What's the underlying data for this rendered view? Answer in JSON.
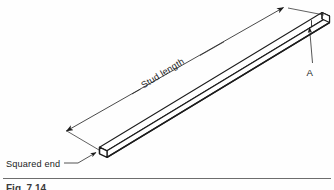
{
  "figure": {
    "type": "engineering-drawing",
    "subject": "stud",
    "background_color": "#fefefe",
    "line_color": "#1c1c1c",
    "labels": {
      "dimension": "Stud length",
      "left_end": "Squared end",
      "detail_callout": "A"
    },
    "caption": "Fig. 7.14",
    "annotations": [
      {
        "name": "dimension-label",
        "text": "Stud length",
        "kind": "dimension",
        "rotation_deg": -31.5
      },
      {
        "name": "left-end-label",
        "text": "Squared end",
        "kind": "leader-note"
      },
      {
        "name": "detail-label",
        "text": "A",
        "kind": "leader-note"
      }
    ],
    "geometry": {
      "bar_start": [
        95,
        155
      ],
      "bar_end": [
        320,
        18
      ],
      "bar_description": "square-section rod drawn in isometric"
    }
  }
}
